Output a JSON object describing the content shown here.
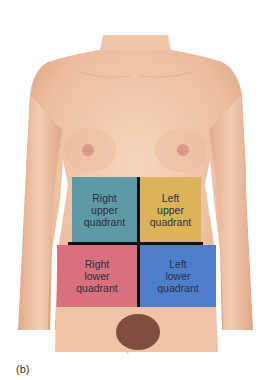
{
  "figure": {
    "label": "(b)"
  },
  "quadrants": [
    {
      "id": "ruq",
      "label": "Right\nupper\nquadrant",
      "color": "#5e9aa3"
    },
    {
      "id": "luq",
      "label": "Left\nupper\nquadrant",
      "color": "#ddb35a"
    },
    {
      "id": "rlq",
      "label": "Right\nlower\nquadrant",
      "color": "#d9707e"
    },
    {
      "id": "llq",
      "label": "Left\nlower\nquadrant",
      "color": "#4f7fcc"
    }
  ],
  "colors": {
    "skin": "#eec3a6",
    "skin_shadow": "#d9a184",
    "divider": "#111111",
    "background": "#ffffff"
  }
}
